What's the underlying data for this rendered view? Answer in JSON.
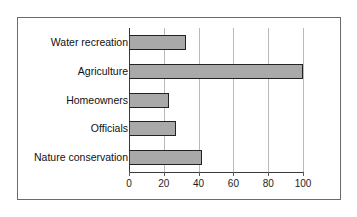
{
  "chart_data": {
    "type": "bar",
    "orientation": "horizontal",
    "title": "",
    "subtitle": "",
    "xlabel": "",
    "ylabel": "",
    "categories": [
      "Water recreation",
      "Agriculture",
      "Homeowners",
      "Officials",
      "Nature conservation"
    ],
    "values": [
      33,
      100,
      23,
      27,
      42
    ],
    "series": [
      {
        "name": "",
        "values": [
          33,
          100,
          23,
          27,
          42
        ]
      }
    ],
    "xlim": [
      0,
      100
    ],
    "xticks": [
      0,
      20,
      40,
      60,
      80,
      100
    ],
    "xtick_labels": [
      "0",
      "20",
      "40",
      "60",
      "80",
      "100"
    ],
    "grid": "vertical",
    "legend": "none",
    "bar_fill_color": "#a9a9a9",
    "bar_border_color": "#222222",
    "gridline_color": "#b9b9b9",
    "axis_color": "#3a3a3a",
    "frame_border_color": "#6b6b6b",
    "background_color": "#ffffff"
  },
  "rows": [
    {
      "label": "Water recreation",
      "value": 33
    },
    {
      "label": "Agriculture",
      "value": 100
    },
    {
      "label": "Homeowners",
      "value": 23
    },
    {
      "label": "Officials",
      "value": 27
    },
    {
      "label": "Nature conservation",
      "value": 42
    }
  ],
  "ticks": [
    {
      "label": "0",
      "value": 0
    },
    {
      "label": "20",
      "value": 20
    },
    {
      "label": "40",
      "value": 40
    },
    {
      "label": "60",
      "value": 60
    },
    {
      "label": "80",
      "value": 80
    },
    {
      "label": "100",
      "value": 100
    }
  ]
}
